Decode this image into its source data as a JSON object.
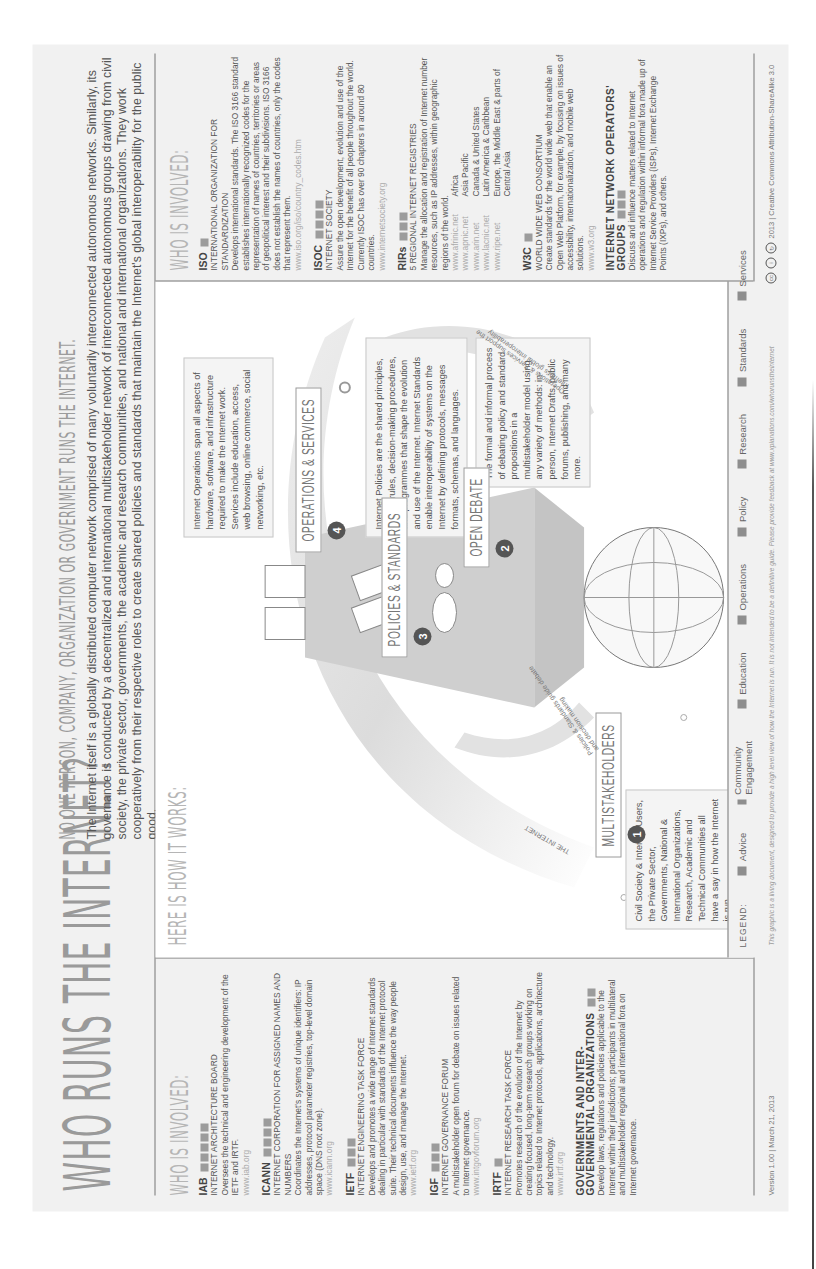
{
  "header": {
    "title": "WHO RUNS THE INTERNET?",
    "tagline": "NO ONE PERSON, COMPANY, ORGANIZATION OR GOVERNMENT RUNS THE INTERNET.",
    "intro": "The Internet itself is a globally distributed computer network comprised of many voluntarily interconnected autonomous networks. Similarly, its governance is conducted by a decentralized and international multistakeholder network of interconnected autonomous groups drawing from civil society, the private sector, governments, the academic and research communities, and national and international organizations. They work cooperatively from their respective roles to create shared policies and standards that maintain the Internet's global interoperability for the public good."
  },
  "left_panel": {
    "heading": "WHO IS INVOLVED:",
    "orgs": [
      {
        "abbr": "IAB",
        "badges": 5,
        "name": "INTERNET ARCHITECTURE BOARD",
        "desc": "Oversees the technical and engineering development of the IETF and IRTF.",
        "url": "www.iab.org"
      },
      {
        "abbr": "ICANN",
        "badges": 4,
        "name": "INTERNET CORPORATION FOR ASSIGNED NAMES AND NUMBERS",
        "desc": "Coordinates the Internet's systems of unique identifiers: IP addresses, protocol parameter registries, top-level domain space (DNS root zone).",
        "url": "www.icann.org"
      },
      {
        "abbr": "IETF",
        "badges": 3,
        "name": "INTERNET ENGINEERING TASK FORCE",
        "desc": "Develops and promotes a wide range of Internet standards dealing in particular with standards of the Internet protocol suite. Their technical documents influence the way people design, use, and manage the Internet.",
        "url": "www.ietf.org"
      },
      {
        "abbr": "IGF",
        "badges": 3,
        "name": "INTERNET GOVERNANCE FORUM",
        "desc": "A multistakeholder open forum for debate on issues related to Internet governance.",
        "url": "www.intgovforum.org"
      },
      {
        "abbr": "IRTF",
        "badges": 1,
        "name": "INTERNET RESEARCH TASK FORCE",
        "desc": "Promotes research of the evolution of the Internet by creating focused, long-term research groups working on topics related to Internet protocols, applications, architecture and technology.",
        "url": "www.irtf.org"
      },
      {
        "abbr": "GOVERNMENTS AND INTER-GOVERNMENTAL ORGANIZATIONS",
        "badges": 2,
        "name": "",
        "desc": "Develop laws, regulations and policies applicable to the Internet within their jurisdictions; participants in multilateral and multistakeholder regional and international fora on Internet governance.",
        "url": ""
      }
    ]
  },
  "center": {
    "heading": "HERE IS HOW IT WORKS:",
    "arc_label": "THE INTERNET",
    "steps": [
      {
        "num": "1",
        "label": "MULTISTAKEHOLDERS",
        "desc": "Civil Society & Internet Users, the Private Sector, Governments, National & International Organizations, Research, Academic and Technical Communities all have a say in how the Internet is run."
      },
      {
        "num": "2",
        "label": "OPEN DEBATE",
        "desc": "The formal and informal process of debating policy and standard propositions in a multistakeholder model using any variety of methods: in-person, Internet Drafts, public forums, publishing, and many more."
      },
      {
        "num": "3",
        "label": "POLICIES & STANDARDS",
        "desc": "Internet Policies are the shared principles, norms, rules, decision-making procedures, and programmes that shape the evolution and use of the Internet. Internet Standards enable interoperability of systems on the Internet by defining protocols, messages formats, schemas, and languages."
      },
      {
        "num": "4",
        "label": "OPERATIONS & SERVICES",
        "desc": "Internet Operations span all aspects of hardware, software, and infrastructure required to make the Internet work. Services include education, access, web browsing, online commerce, social networking, etc."
      }
    ],
    "arrow_labels": {
      "policies_guide": "Policies & Standards guide debate and decision making",
      "operations_support": "Operations & Services support the Internet's global interoperability"
    },
    "legend": {
      "label": "LEGEND:",
      "items": [
        "Advice",
        "Community Engagement",
        "Education",
        "Operations",
        "Policy",
        "Research",
        "Standards",
        "Services"
      ]
    }
  },
  "right_panel": {
    "heading": "WHO IS INVOLVED:",
    "iso": {
      "abbr": "ISO",
      "badges": 1,
      "name": "INTERNATIONAL ORGANIZATION FOR STANDARDIZATION",
      "desc": "Develops international standards. The ISO 3166 standard establishes internationally recognized codes for the representation of names of countries, territories or areas of geopolitical interest and their subdivisions. ISO 3166 does not establish the names of countries, only the codes that represent them.",
      "url": "www.iso.org/iso/country_codes.htm"
    },
    "isoc": {
      "abbr": "ISOC",
      "badges": 4,
      "name": "INTERNET SOCIETY",
      "desc": "Assure the open development, evolution and use of the Internet for the benefit of all people throughout the world. Currently ISOC has over 90 chapters in around 80 countries.",
      "url": "www.internetsociety.org"
    },
    "rirs": {
      "abbr": "RIRs",
      "badges": 3,
      "name": "5 REGIONAL INTERNET REGISTRIES",
      "desc": "Manage the allocation and registration of Internet number resources, such as IP addresses, within geographic regions of the world.",
      "regions": [
        {
          "url": "www.afrinic.net",
          "region": "Africa"
        },
        {
          "url": "www.apnic.net",
          "region": "Asia Pacific"
        },
        {
          "url": "www.arin.net",
          "region": "Canada & United States"
        },
        {
          "url": "www.lacnic.net",
          "region": "Latin America & Caribbean"
        },
        {
          "url": "www.ripe.net",
          "region": "Europe, the Middle East & parts of Central Asia"
        }
      ]
    },
    "w3c": {
      "abbr": "W3C",
      "badges": 1,
      "name": "WORLD WIDE WEB CONSORTIUM",
      "desc": "Create standards for the world wide web that enable an Open Web Platform, for example, by focusing on issues of accessibility, internationalization, and mobile web solutions.",
      "url": "www.w3.org"
    },
    "inog": {
      "abbr": "INTERNET NETWORK OPERATORS' GROUPS",
      "badges": 3,
      "desc": "Discuss and influence matters related to Internet operations and regulation within informal fora made up of Internet Service Providers (ISPs), Internet Exchange Points (IXPs), and others."
    }
  },
  "footer": {
    "version": "Version 1.00  |  March 21, 2013",
    "note": "This graphic is a living document, designed to provide a high level view of how the Internet is run. It is not intended to be a definitive guide. Please provide feedback at www.xplanations.com/whorunstheinternet",
    "license": "2013 | Creative Commons Attribution-ShareAlike 3.0"
  },
  "colors": {
    "background": "#f1f1f1",
    "text": "#555555",
    "heading": "#9a9a9a",
    "rule": "#777777",
    "badge": "#9c9c9c"
  }
}
